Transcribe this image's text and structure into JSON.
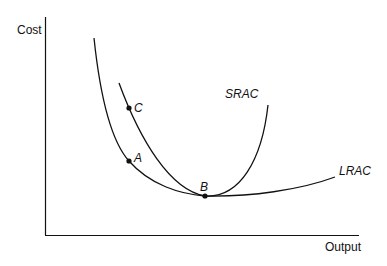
{
  "diagram": {
    "axes": {
      "y_label": "Cost",
      "x_label": "Output"
    },
    "curves": [
      {
        "name": "SRAC",
        "label": "SRAC"
      },
      {
        "name": "LRAC",
        "label": "LRAC"
      }
    ],
    "points": [
      {
        "name": "A",
        "label": "A"
      },
      {
        "name": "B",
        "label": "B"
      },
      {
        "name": "C",
        "label": "C"
      }
    ],
    "colors": {
      "line": "#111111",
      "background": "#ffffff"
    }
  }
}
